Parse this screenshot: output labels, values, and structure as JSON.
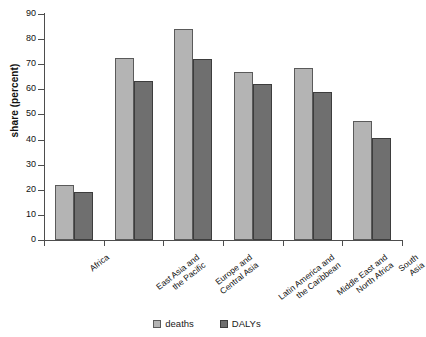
{
  "chart_data": {
    "type": "bar",
    "title": "",
    "xlabel": "",
    "ylabel": "share (percent)",
    "ylim": [
      0,
      90
    ],
    "ystep": 10,
    "yticks": [
      0,
      10,
      20,
      30,
      40,
      50,
      60,
      70,
      80,
      90
    ],
    "grid": false,
    "legend_position": "bottom-center",
    "categories": [
      "Africa",
      "East Asia and\nthe Pacific",
      "Europe and\nCentral Asia",
      "Latin America and\nthe Caribbean",
      "Middle East and\nNorth Africa",
      "South Asia"
    ],
    "series": [
      {
        "name": "deaths",
        "color": "#b4b4b4",
        "values": [
          22,
          72.5,
          84,
          67,
          68.5,
          47.5
        ]
      },
      {
        "name": "DALYs",
        "color": "#6f6f6f",
        "values": [
          19,
          63.5,
          72,
          62,
          59,
          40.5
        ]
      }
    ]
  },
  "legend": {
    "items": [
      {
        "label": "deaths"
      },
      {
        "label": "DALYs"
      }
    ]
  },
  "colors": {
    "deaths": "#b4b4b4",
    "dalys": "#6f6f6f",
    "axis": "#4d4d4d",
    "background": "#ffffff"
  }
}
